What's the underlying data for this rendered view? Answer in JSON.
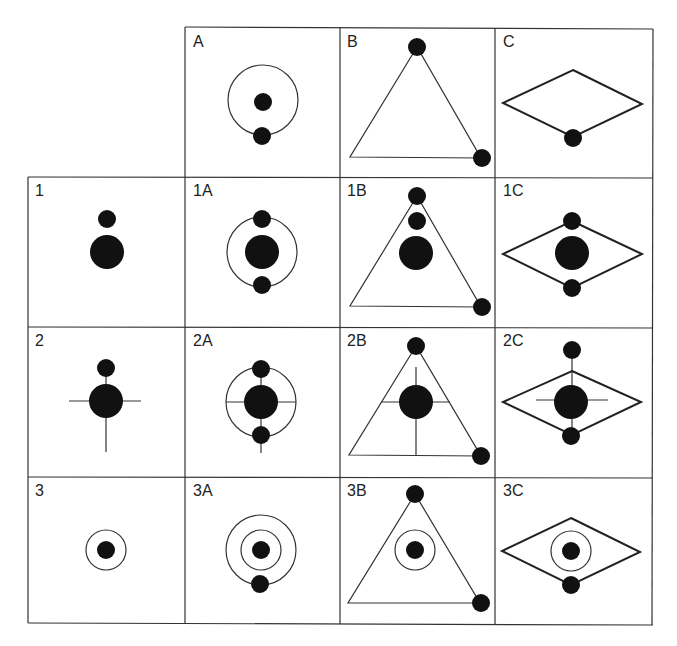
{
  "diagram": {
    "grid": {
      "columns_x": [
        28,
        185,
        340,
        495,
        653
      ],
      "rows_y": [
        27,
        177,
        327,
        477,
        625
      ],
      "line_color": "#333333",
      "fill_color": "#111111"
    },
    "column_headers": [
      "A",
      "B",
      "C"
    ],
    "row_headers": [
      "1",
      "2",
      "3"
    ],
    "cells": [
      {
        "id": "A",
        "label": "A",
        "row": 0,
        "col": 1
      },
      {
        "id": "B",
        "label": "B",
        "row": 0,
        "col": 2
      },
      {
        "id": "C",
        "label": "C",
        "row": 0,
        "col": 3
      },
      {
        "id": "1",
        "label": "1",
        "row": 1,
        "col": 0
      },
      {
        "id": "1A",
        "label": "1A",
        "row": 1,
        "col": 1
      },
      {
        "id": "1B",
        "label": "1B",
        "row": 1,
        "col": 2
      },
      {
        "id": "1C",
        "label": "1C",
        "row": 1,
        "col": 3
      },
      {
        "id": "2",
        "label": "2",
        "row": 2,
        "col": 0
      },
      {
        "id": "2A",
        "label": "2A",
        "row": 2,
        "col": 1
      },
      {
        "id": "2B",
        "label": "2B",
        "row": 2,
        "col": 2
      },
      {
        "id": "2C",
        "label": "2C",
        "row": 2,
        "col": 3
      },
      {
        "id": "3",
        "label": "3",
        "row": 3,
        "col": 0
      },
      {
        "id": "3A",
        "label": "3A",
        "row": 3,
        "col": 1
      },
      {
        "id": "3B",
        "label": "3B",
        "row": 3,
        "col": 2
      },
      {
        "id": "3C",
        "label": "3C",
        "row": 3,
        "col": 3
      }
    ]
  }
}
